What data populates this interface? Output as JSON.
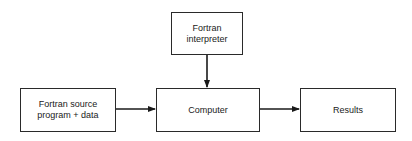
{
  "diagram": {
    "type": "flowchart",
    "nodes": [
      {
        "id": "source",
        "lines": [
          "Fortran source",
          "program + data"
        ]
      },
      {
        "id": "interpreter",
        "lines": [
          "Fortran",
          "interpreter"
        ]
      },
      {
        "id": "computer",
        "lines": [
          "Computer"
        ]
      },
      {
        "id": "results",
        "lines": [
          "Results"
        ]
      }
    ],
    "edges": [
      {
        "from": "source",
        "to": "computer"
      },
      {
        "from": "interpreter",
        "to": "computer"
      },
      {
        "from": "computer",
        "to": "results"
      }
    ]
  }
}
